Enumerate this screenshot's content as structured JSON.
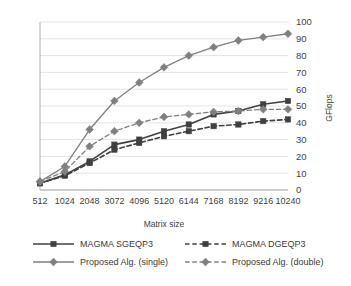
{
  "chart_data": {
    "type": "line",
    "title": "",
    "xlabel": "Matrix size",
    "ylabel": "GFlops",
    "categories": [
      "512",
      "1024",
      "2048",
      "3072",
      "4096",
      "5120",
      "6144",
      "7168",
      "8192",
      "9216",
      "10240"
    ],
    "ylim": [
      0,
      100
    ],
    "yticks": [
      "0",
      "10",
      "20",
      "30",
      "40",
      "50",
      "60",
      "70",
      "80",
      "90",
      "100"
    ],
    "grid": true,
    "legend_position": "bottom",
    "series": [
      {
        "name": "MAGMA SGEQP3",
        "color": "#404040",
        "dash": "solid",
        "marker": "square",
        "values": [
          4,
          9,
          17,
          27,
          30,
          35,
          39,
          45,
          47,
          51,
          53
        ]
      },
      {
        "name": "MAGMA DGEQP3",
        "color": "#404040",
        "dash": "dashed",
        "marker": "square",
        "values": [
          4,
          8.5,
          16,
          24,
          28,
          32,
          35,
          38,
          39,
          41,
          42
        ]
      },
      {
        "name": "Proposed Alg. (single)",
        "color": "#808080",
        "dash": "solid",
        "marker": "diamond",
        "values": [
          5,
          14,
          36,
          53,
          64,
          73,
          80,
          85,
          89,
          91,
          93
        ]
      },
      {
        "name": "Proposed Alg. (double)",
        "color": "#808080",
        "dash": "dashed",
        "marker": "diamond",
        "values": [
          5,
          11,
          26,
          35,
          40,
          43.5,
          45,
          46.5,
          47,
          48,
          48
        ]
      }
    ]
  },
  "axes": {
    "y_axis_title": "GFlops",
    "x_axis_title": "Matrix size"
  }
}
